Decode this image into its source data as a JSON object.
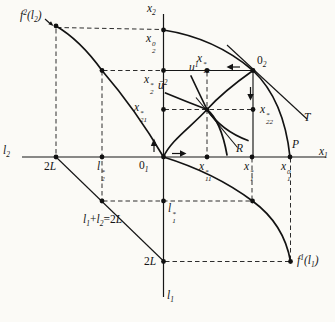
{
  "figure": {
    "background": "#fbfaf6",
    "ink": "#141414",
    "labels": [
      {
        "name": "label-f2-of-l2",
        "x": 20,
        "y": 10,
        "seq": [
          [
            "t",
            "f"
          ],
          [
            "sup",
            "2"
          ],
          [
            "t",
            "("
          ],
          [
            "t",
            "l"
          ],
          [
            "sub",
            "2"
          ],
          [
            "t",
            ")"
          ]
        ]
      },
      {
        "name": "label-x2-axis",
        "x": 147,
        "y": 3,
        "seq": [
          [
            "t",
            "x"
          ],
          [
            "sub",
            "2"
          ]
        ]
      },
      {
        "name": "label-x2-0",
        "x": 146,
        "y": 33,
        "seq": [
          [
            "t",
            "x"
          ],
          [
            "ss",
            "0",
            "2"
          ]
        ]
      },
      {
        "name": "label-x2-star",
        "x": 144,
        "y": 74,
        "seq": [
          [
            "t",
            "x"
          ],
          [
            "ss",
            "*",
            "2"
          ]
        ]
      },
      {
        "name": "label-x21-star",
        "x": 134,
        "y": 102,
        "seq": [
          [
            "t",
            "x"
          ],
          [
            "ss",
            "*",
            "21"
          ]
        ]
      },
      {
        "name": "label-x12-star",
        "x": 197,
        "y": 53,
        "seq": [
          [
            "t",
            "x"
          ],
          [
            "ss",
            "*",
            "12"
          ]
        ]
      },
      {
        "name": "label-origin-2",
        "x": 257,
        "y": 55,
        "seq": [
          [
            "n",
            "0"
          ],
          [
            "sub",
            "2"
          ]
        ]
      },
      {
        "name": "label-u1",
        "x": 189,
        "y": 62,
        "seq": [
          [
            "t",
            "u"
          ],
          [
            "sup",
            "1"
          ]
        ]
      },
      {
        "name": "label-u2-bar",
        "x": 158,
        "y": 80,
        "seq": [
          [
            "t",
            "ū"
          ],
          [
            "sup",
            "2"
          ]
        ]
      },
      {
        "name": "label-x22-star",
        "x": 260,
        "y": 104,
        "seq": [
          [
            "t",
            "x"
          ],
          [
            "ss",
            "*",
            "22"
          ]
        ]
      },
      {
        "name": "label-contract-curve-R",
        "x": 236,
        "y": 143,
        "seq": [
          [
            "t",
            "R"
          ]
        ]
      },
      {
        "name": "label-tangent-T",
        "x": 304,
        "y": 112,
        "seq": [
          [
            "t",
            "T"
          ]
        ]
      },
      {
        "name": "label-P",
        "x": 292,
        "y": 139,
        "seq": [
          [
            "t",
            "P"
          ]
        ]
      },
      {
        "name": "label-x1-axis",
        "x": 319,
        "y": 146,
        "seq": [
          [
            "t",
            "x"
          ],
          [
            "sub",
            "1"
          ]
        ]
      },
      {
        "name": "label-l2-axis",
        "x": 3,
        "y": 145,
        "seq": [
          [
            "t",
            "l"
          ],
          [
            "sub",
            "2"
          ]
        ]
      },
      {
        "name": "label-2L-left",
        "x": 44,
        "y": 161,
        "seq": [
          [
            "n",
            "2"
          ],
          [
            "t",
            "L"
          ]
        ]
      },
      {
        "name": "label-l2-star",
        "x": 97,
        "y": 161,
        "seq": [
          [
            "t",
            "l"
          ],
          [
            "ss",
            "*",
            "2"
          ]
        ]
      },
      {
        "name": "label-origin-1",
        "x": 139,
        "y": 160,
        "seq": [
          [
            "n",
            "0"
          ],
          [
            "sub",
            "1"
          ]
        ]
      },
      {
        "name": "label-x11-star",
        "x": 199,
        "y": 161,
        "seq": [
          [
            "t",
            "x"
          ],
          [
            "ss",
            "*",
            "11"
          ]
        ]
      },
      {
        "name": "label-x1-star",
        "x": 244,
        "y": 161,
        "seq": [
          [
            "t",
            "x"
          ],
          [
            "ss",
            "*",
            "1"
          ]
        ]
      },
      {
        "name": "label-x1-0",
        "x": 281,
        "y": 161,
        "seq": [
          [
            "t",
            "x"
          ],
          [
            "ss",
            "0",
            "1"
          ]
        ]
      },
      {
        "name": "label-l1-star",
        "x": 168,
        "y": 203,
        "seq": [
          [
            "t",
            "l"
          ],
          [
            "ss",
            "*",
            "1"
          ]
        ]
      },
      {
        "name": "label-labor-constraint",
        "x": 83,
        "y": 214,
        "seq": [
          [
            "t",
            "l"
          ],
          [
            "sub",
            "1"
          ],
          [
            "n",
            "+"
          ],
          [
            "t",
            "l"
          ],
          [
            "sub",
            "2"
          ],
          [
            "n",
            "="
          ],
          [
            "n",
            "2"
          ],
          [
            "t",
            "L"
          ]
        ]
      },
      {
        "name": "label-2L-bottom",
        "x": 144,
        "y": 256,
        "seq": [
          [
            "n",
            "2"
          ],
          [
            "t",
            "L"
          ]
        ]
      },
      {
        "name": "label-f1-of-l1",
        "x": 297,
        "y": 255,
        "seq": [
          [
            "t",
            "f"
          ],
          [
            "sup",
            "1"
          ],
          [
            "t",
            "("
          ],
          [
            "t",
            "l"
          ],
          [
            "sub",
            "1"
          ],
          [
            "t",
            ")"
          ]
        ]
      },
      {
        "name": "label-l1-axis",
        "x": 167,
        "y": 290,
        "seq": [
          [
            "t",
            "l"
          ],
          [
            "sub",
            "1"
          ]
        ]
      }
    ]
  }
}
